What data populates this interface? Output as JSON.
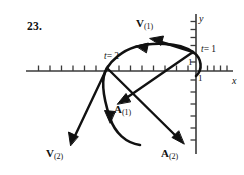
{
  "figure": {
    "problem_number": "23.",
    "axes": {
      "x_axis_label": "x",
      "y_axis_label": "y",
      "x_unit_label": "1",
      "y_unit_label": "1",
      "x_ticks_left_of_origin": 12,
      "x_ticks_right_of_origin": 5,
      "y_ticks_above_origin": 5,
      "y_ticks_below_origin": 6,
      "tick_spacing_px": 11.5,
      "origin_px": {
        "x": 196,
        "y": 71
      }
    },
    "parameter_markers": [
      {
        "name": "t1",
        "text_var": "t",
        "text_eq": "= 1"
      },
      {
        "name": "t2",
        "text_var": "t",
        "text_eq": "= 2"
      }
    ],
    "vectors": [
      {
        "name": "velocity-at-t1",
        "letter": "V",
        "subscript": "(1)"
      },
      {
        "name": "velocity-at-t2",
        "letter": "V",
        "subscript": "(2)"
      },
      {
        "name": "acceleration-at-t1",
        "letter": "A",
        "subscript": "(1)"
      },
      {
        "name": "acceleration-at-t2",
        "letter": "A",
        "subscript": "(2)"
      }
    ],
    "colors": {
      "ink": "#111111",
      "axis": "#3a3a3a",
      "background": "#ffffff"
    }
  }
}
